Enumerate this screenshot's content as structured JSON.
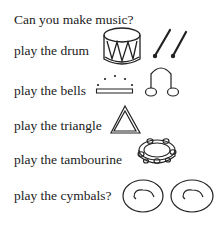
{
  "title": "Can you make music?",
  "items": [
    {
      "label": "play the drum",
      "icon": "drum-icon"
    },
    {
      "label": "play the bells",
      "icon": "bells-icon"
    },
    {
      "label": "play the triangle",
      "icon": "triangle-icon"
    },
    {
      "label": "play the tambourine",
      "icon": "tambourine-icon"
    },
    {
      "label": "play the cymbals?",
      "icon": "cymbals-icon"
    }
  ]
}
